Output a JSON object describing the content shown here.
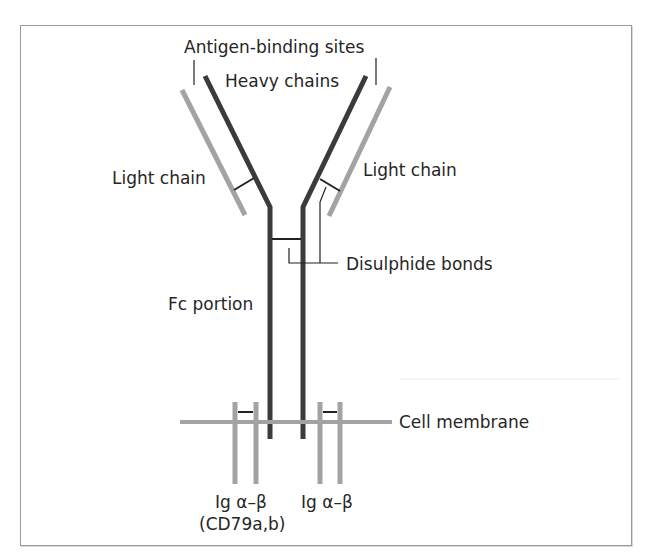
{
  "diagram": {
    "labels": {
      "antigen_binding_sites": "Antigen-binding sites",
      "heavy_chains": "Heavy chains",
      "light_chain_left": "Light chain",
      "light_chain_right": "Light chain",
      "disulphide_bonds": "Disulphide bonds",
      "fc_portion": "Fc portion",
      "cell_membrane": "Cell membrane",
      "ig_ab_left_line1": "Ig α–β",
      "ig_ab_left_line2": "(CD79a,b)",
      "ig_ab_right": "Ig α–β"
    },
    "colors": {
      "heavy_chain": "#3b3b3b",
      "light_chain": "#a3a3a3",
      "membrane": "#a3a3a3",
      "text": "#262626"
    }
  }
}
